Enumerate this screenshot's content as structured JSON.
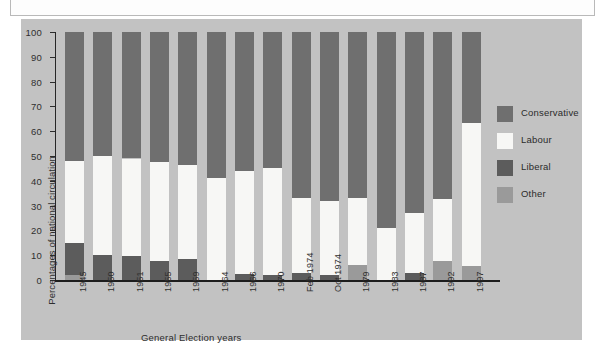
{
  "chart_data": {
    "type": "bar",
    "subtype": "100% stacked column",
    "title": "",
    "xlabel": "General Election years",
    "ylabel": "Percentages of national circulation",
    "ylim": [
      0,
      100
    ],
    "yticks": [
      0,
      10,
      20,
      30,
      40,
      50,
      60,
      70,
      80,
      90,
      100
    ],
    "grid": false,
    "legend_position": "right",
    "categories": [
      "1945",
      "1950",
      "1951",
      "1955",
      "1959",
      "1964",
      "1966",
      "1970",
      "Feb 1974",
      "Oct 1974",
      "1979",
      "1983",
      "1987",
      "1992",
      "1997"
    ],
    "series": [
      {
        "name": "Other",
        "color": "#9a9a9a",
        "values": [
          2,
          0,
          0,
          0,
          0,
          0,
          0,
          0,
          0,
          0,
          6,
          0,
          0,
          7.5,
          5.5
        ]
      },
      {
        "name": "Liberal",
        "color": "#5c5c5c",
        "values": [
          13,
          10,
          9.5,
          7.5,
          8.5,
          0,
          2.5,
          2,
          3,
          2,
          0,
          0,
          3,
          0,
          0
        ]
      },
      {
        "name": "Labour",
        "color": "#f7f7f5",
        "values": [
          33,
          40,
          39.5,
          40,
          38,
          41,
          41.5,
          43,
          30,
          30,
          27,
          21,
          24,
          25,
          58
        ]
      },
      {
        "name": "Conservative",
        "color": "#6f6f6f",
        "values": [
          52,
          50,
          51,
          52.5,
          53.5,
          59,
          56,
          55,
          67,
          68,
          67,
          79,
          73,
          67.5,
          36.5
        ]
      }
    ],
    "stack_order_bottom_to_top": [
      "Other",
      "Liberal",
      "Labour",
      "Conservative"
    ],
    "cumulative_tops": {
      "1945": {
        "other": 2,
        "liberal": 15,
        "labour": 48,
        "conservative": 100
      },
      "1950": {
        "other": 0,
        "liberal": 10,
        "labour": 50,
        "conservative": 100
      },
      "1951": {
        "other": 0,
        "liberal": 9.5,
        "labour": 49,
        "conservative": 100
      },
      "1955": {
        "other": 0,
        "liberal": 7.5,
        "labour": 47.5,
        "conservative": 100
      },
      "1959": {
        "other": 0,
        "liberal": 8.5,
        "labour": 46.5,
        "conservative": 100
      },
      "1964": {
        "other": 0,
        "liberal": 0,
        "labour": 41,
        "conservative": 100
      },
      "1966": {
        "other": 0,
        "liberal": 2.5,
        "labour": 44,
        "conservative": 100
      },
      "1970": {
        "other": 0,
        "liberal": 2,
        "labour": 45,
        "conservative": 100
      },
      "Feb 1974": {
        "other": 0,
        "liberal": 3,
        "labour": 33,
        "conservative": 100
      },
      "Oct 1974": {
        "other": 0,
        "liberal": 2,
        "labour": 32,
        "conservative": 100
      },
      "1979": {
        "other": 6,
        "liberal": 6,
        "labour": 33,
        "conservative": 100
      },
      "1983": {
        "other": 0,
        "liberal": 0,
        "labour": 21,
        "conservative": 100
      },
      "1987": {
        "other": 0,
        "liberal": 3,
        "labour": 27,
        "conservative": 100
      },
      "1992": {
        "other": 7.5,
        "liberal": 7.5,
        "labour": 32.5,
        "conservative": 100
      },
      "1997": {
        "other": 5.5,
        "liberal": 5.5,
        "labour": 63.5,
        "conservative": 100
      }
    }
  },
  "axes": {
    "y_title": "Percentages of national circulation",
    "x_title": "General Election years",
    "y_tick_labels": [
      "100",
      "90",
      "80",
      "70",
      "60",
      "50",
      "40",
      "30",
      "20",
      "10",
      "0"
    ]
  },
  "legend": {
    "items": [
      {
        "label": "Conservative",
        "color": "#6f6f6f"
      },
      {
        "label": "Labour",
        "color": "#f7f7f5"
      },
      {
        "label": "Liberal",
        "color": "#5c5c5c"
      },
      {
        "label": "Other",
        "color": "#9a9a9a"
      }
    ]
  },
  "colors": {
    "panel_background": "#c2c2c2",
    "axis": "#1d1d1d",
    "text": "#2d2d2d",
    "page_background": "#ffffff"
  }
}
